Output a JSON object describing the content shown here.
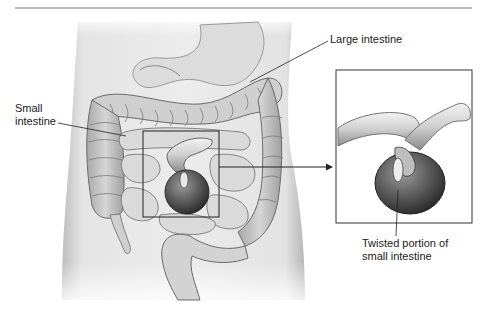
{
  "figure": {
    "labels": {
      "large_intestine": "Large intestine",
      "small_intestine_line1": "Small",
      "small_intestine_line2": "intestine",
      "twisted_line1": "Twisted portion of",
      "twisted_line2": "small intestine"
    },
    "colors": {
      "rule": "#7a7a7a",
      "outline": "#222222",
      "torso": "#e6e6e6",
      "tissue": "#c8c8c8",
      "dark_tissue": "#4a4a4a",
      "text": "#1a1a1a"
    }
  }
}
